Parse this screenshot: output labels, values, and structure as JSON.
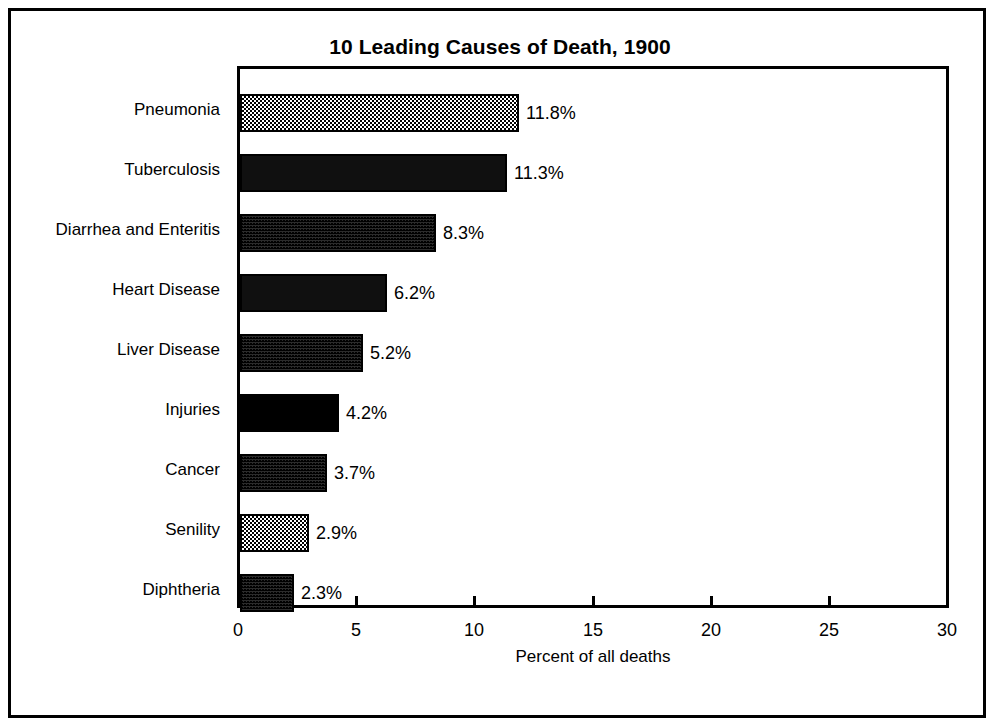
{
  "chart_data": {
    "type": "bar",
    "orientation": "horizontal",
    "title": "10 Leading Causes of Death, 1900",
    "xlabel": "Percent of all deaths",
    "ylabel": "",
    "xlim": [
      0,
      30
    ],
    "xticks": [
      0,
      5,
      10,
      15,
      20,
      25,
      30
    ],
    "xtick_labels": [
      "0",
      "5",
      "10",
      "15",
      "20",
      "25",
      "30"
    ],
    "grid": false,
    "legend": "none",
    "categories": [
      "Pneumonia",
      "Tuberculosis",
      "Diarrhea and Enteritis",
      "Heart Disease",
      "Liver Disease",
      "Injuries",
      "Cancer",
      "Senility",
      "Diphtheria"
    ],
    "values": [
      11.8,
      11.3,
      8.3,
      6.2,
      5.2,
      4.2,
      3.7,
      2.9,
      2.3
    ],
    "value_labels": [
      "11.8%",
      "11.3%",
      "8.3%",
      "6.2%",
      "5.2%",
      "4.2%",
      "3.7%",
      "2.9%",
      "2.3%"
    ],
    "bar_fills": [
      "mid",
      "vdark",
      "dark",
      "vdark",
      "dark",
      "solid",
      "dark",
      "mid",
      "dark"
    ],
    "colors": {
      "axis": "#000000",
      "text": "#000000",
      "background": "#ffffff",
      "bar_outline": "#000000"
    }
  }
}
